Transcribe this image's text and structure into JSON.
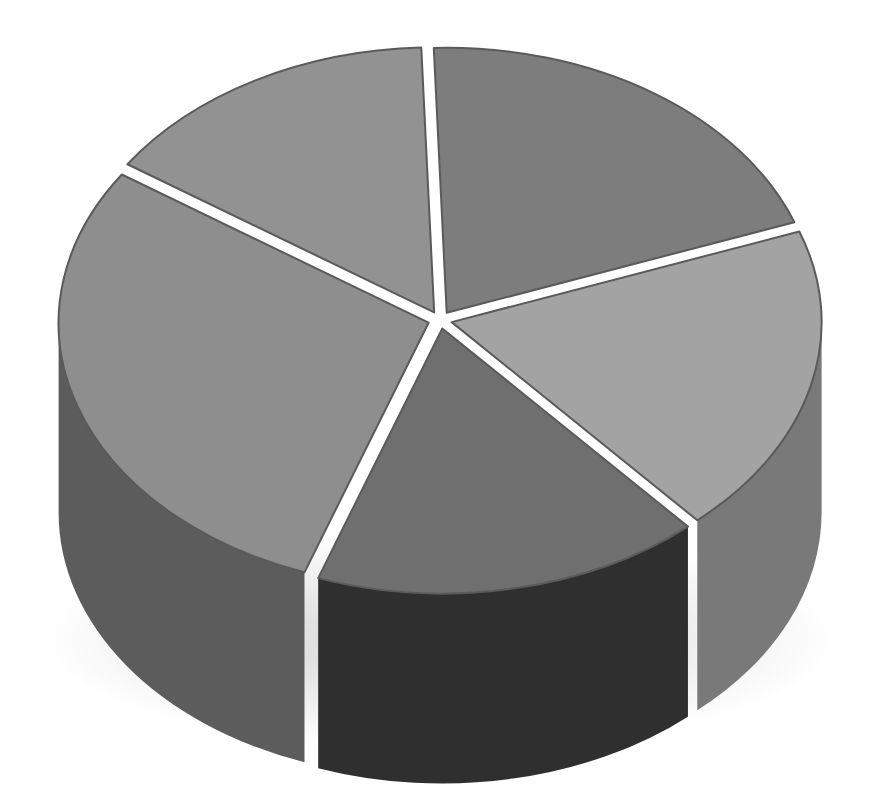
{
  "chart_data": {
    "type": "pie",
    "style": "3d-exploded",
    "title": "",
    "legend": "none",
    "labels": "none",
    "categories": [
      "Slice A",
      "Slice B",
      "Slice C",
      "Slice D",
      "Slice E"
    ],
    "values": [
      20,
      19,
      17,
      29,
      15
    ],
    "unit": "%",
    "colors_top": [
      "#7d7d7d",
      "#a3a3a3",
      "#6f6f6f",
      "#8e8e8e",
      "#929292"
    ],
    "colors_side": [
      "#6a6a6a",
      "#797979",
      "#2f2f2f",
      "#5c5c5c",
      "#6e6e6e"
    ]
  }
}
